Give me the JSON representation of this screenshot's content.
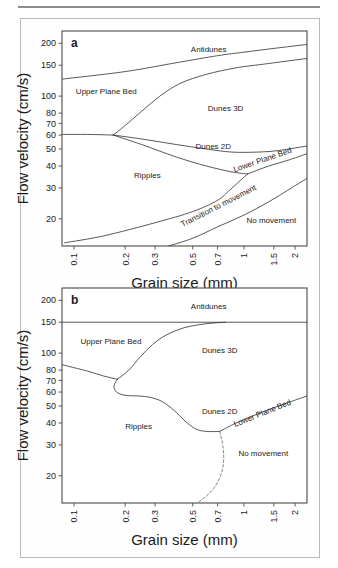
{
  "figure": {
    "type": "bedform-stability-diagram",
    "background": "#ffffff",
    "frame_color": "#4a4a4a",
    "line_color": "#3a3a3a",
    "panel_border_color": "#b9b9b9",
    "rule_color": "#8d8d8d"
  },
  "axes": {
    "xlabel": "Grain size (mm)",
    "ylabel": "Flow velocity (cm/s)",
    "xscale": "log",
    "yscale": "log",
    "xlim": [
      0.085,
      2.35
    ],
    "ylim": [
      14,
      235
    ],
    "xticks": [
      0.1,
      0.2,
      0.3,
      0.5,
      0.7,
      1,
      1.5,
      2
    ],
    "xticklabels": [
      "0.1",
      "0.2",
      "0.3",
      "0.5",
      "0.7",
      "1",
      "1.5",
      "2"
    ],
    "yticks": [
      20,
      30,
      40,
      50,
      60,
      70,
      80,
      100,
      150,
      200
    ],
    "yticklabels": [
      "20",
      "30",
      "40",
      "50",
      "60",
      "70",
      "80",
      "100",
      "150",
      "200"
    ],
    "grid": false,
    "legend": "none"
  },
  "panel_a": {
    "label": "a",
    "regions": [
      {
        "name": "Antidunes",
        "label": "Antidunes",
        "x": 0.62,
        "y": 178
      },
      {
        "name": "Upper Plane Bed",
        "label": "Upper Plane Bed",
        "x": 0.155,
        "y": 103
      },
      {
        "name": "Dunes 3D",
        "label": "Dunes 3D",
        "x": 0.78,
        "y": 82
      },
      {
        "name": "Dunes 2D",
        "label": "Dunes 2D",
        "x": 0.66,
        "y": 50
      },
      {
        "name": "Lower Plane Bed",
        "label": "Lower Plane Bed",
        "x": 1.3,
        "y": 42,
        "rotation": -19
      },
      {
        "name": "Ripples",
        "label": "Ripples",
        "x": 0.27,
        "y": 34
      },
      {
        "name": "Transition to movement",
        "label": "Transition to movement",
        "x": 0.72,
        "y": 23,
        "rotation": -27
      },
      {
        "name": "No movement",
        "label": "No movement",
        "x": 1.45,
        "y": 19
      }
    ],
    "boundaries": [
      {
        "name": "antidunes-upper-plane-bed",
        "style": "solid",
        "points": [
          [
            0.085,
            125
          ],
          [
            0.2,
            138
          ],
          [
            0.4,
            155
          ],
          [
            0.7,
            170
          ],
          [
            1.0,
            178
          ],
          [
            1.5,
            187
          ],
          [
            2.35,
            197
          ]
        ]
      },
      {
        "name": "upper-plane-bed-dunes3d",
        "style": "solid",
        "points": [
          [
            0.17,
            60
          ],
          [
            0.2,
            68
          ],
          [
            0.25,
            82
          ],
          [
            0.32,
            100
          ],
          [
            0.42,
            118
          ],
          [
            0.6,
            133
          ],
          [
            0.9,
            145
          ],
          [
            1.3,
            152
          ],
          [
            2.35,
            164
          ]
        ]
      },
      {
        "name": "ripples-upper-plane-bed-left",
        "style": "solid",
        "points": [
          [
            0.085,
            60.5
          ],
          [
            0.12,
            60.5
          ],
          [
            0.17,
            60
          ]
        ]
      },
      {
        "name": "dunes3d-dunes2d",
        "style": "solid",
        "points": [
          [
            0.17,
            60
          ],
          [
            0.25,
            57
          ],
          [
            0.4,
            53
          ],
          [
            0.6,
            50
          ],
          [
            0.85,
            48
          ],
          [
            1.2,
            48
          ],
          [
            1.6,
            49
          ],
          [
            2.35,
            52
          ]
        ]
      },
      {
        "name": "ripples-dunes2d",
        "style": "solid",
        "points": [
          [
            0.17,
            60
          ],
          [
            0.25,
            53
          ],
          [
            0.4,
            45
          ],
          [
            0.6,
            40
          ],
          [
            0.85,
            37
          ],
          [
            1.05,
            36
          ]
        ]
      },
      {
        "name": "lower-plane-bed-top",
        "style": "solid",
        "points": [
          [
            1.05,
            36
          ],
          [
            1.4,
            40
          ],
          [
            1.8,
            43
          ],
          [
            2.35,
            47
          ]
        ]
      },
      {
        "name": "transition-to-movement-upper",
        "style": "solid",
        "points": [
          [
            1.05,
            36
          ],
          [
            0.95,
            33
          ],
          [
            0.82,
            29
          ],
          [
            0.7,
            25.5
          ],
          [
            0.5,
            22
          ],
          [
            0.3,
            19
          ],
          [
            0.15,
            16
          ],
          [
            0.088,
            14.6
          ]
        ]
      },
      {
        "name": "no-movement",
        "style": "solid",
        "points": [
          [
            0.36,
            14
          ],
          [
            0.5,
            15.5
          ],
          [
            0.7,
            18
          ],
          [
            1.0,
            21
          ],
          [
            1.4,
            25
          ],
          [
            1.8,
            29
          ],
          [
            2.35,
            34
          ]
        ]
      }
    ]
  },
  "panel_b": {
    "label": "b",
    "regions": [
      {
        "name": "Antidunes",
        "label": "Antidunes",
        "x": 0.62,
        "y": 178
      },
      {
        "name": "Upper Plane Bed",
        "label": "Upper Plane Bed",
        "x": 0.165,
        "y": 113
      },
      {
        "name": "Dunes 3D",
        "label": "Dunes 3D",
        "x": 0.72,
        "y": 100
      },
      {
        "name": "Dunes 2D",
        "label": "Dunes 2D",
        "x": 0.72,
        "y": 45
      },
      {
        "name": "Lower Plane Bed",
        "label": "Lower Plane Bed",
        "x": 1.3,
        "y": 44,
        "rotation": -22
      },
      {
        "name": "Ripples",
        "label": "Ripples",
        "x": 0.24,
        "y": 37
      },
      {
        "name": "No movement",
        "label": "No movement",
        "x": 1.3,
        "y": 26
      }
    ],
    "boundaries": [
      {
        "name": "antidunes-horizontal",
        "style": "solid",
        "points": [
          [
            0.085,
            150
          ],
          [
            2.35,
            150
          ]
        ]
      },
      {
        "name": "upper-plane-bed-dunes3d",
        "style": "solid",
        "points": [
          [
            0.18,
            71
          ],
          [
            0.21,
            80
          ],
          [
            0.245,
            95
          ],
          [
            0.29,
            112
          ],
          [
            0.35,
            127
          ],
          [
            0.45,
            140
          ],
          [
            0.6,
            147
          ],
          [
            0.78,
            150
          ]
        ]
      },
      {
        "name": "ripples-upper-plane-bed-left",
        "style": "solid",
        "points": [
          [
            0.085,
            86
          ],
          [
            0.12,
            79
          ],
          [
            0.15,
            74
          ],
          [
            0.18,
            71
          ]
        ]
      },
      {
        "name": "ripples-dunes-lobe",
        "style": "solid",
        "points": [
          [
            0.18,
            71
          ],
          [
            0.172,
            65
          ],
          [
            0.178,
            60
          ],
          [
            0.2,
            57.5
          ],
          [
            0.24,
            57
          ],
          [
            0.28,
            56
          ],
          [
            0.33,
            53
          ],
          [
            0.39,
            47
          ],
          [
            0.45,
            41
          ],
          [
            0.52,
            37
          ],
          [
            0.6,
            35.8
          ],
          [
            0.72,
            35.8
          ]
        ]
      },
      {
        "name": "dunes2d-lower-plane-bed",
        "style": "solid",
        "points": [
          [
            0.72,
            35.8
          ],
          [
            0.9,
            40
          ],
          [
            1.2,
            45
          ],
          [
            1.6,
            50
          ],
          [
            2.35,
            57
          ]
        ]
      },
      {
        "name": "no-movement-dashed",
        "style": "dashed",
        "points": [
          [
            0.72,
            35.8
          ],
          [
            0.75,
            30
          ],
          [
            0.76,
            25
          ],
          [
            0.74,
            21
          ],
          [
            0.68,
            17.5
          ],
          [
            0.6,
            15.3
          ],
          [
            0.53,
            14
          ]
        ]
      }
    ]
  }
}
